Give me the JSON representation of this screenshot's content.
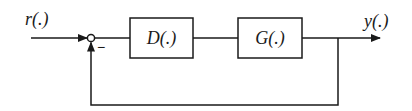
{
  "diagram": {
    "type": "feedback-control-loop",
    "input": {
      "label": "r(.)"
    },
    "output": {
      "label": "y(.)"
    },
    "summing_junction": {
      "sign_feedback": "−"
    },
    "blocks": [
      {
        "id": "controller",
        "label": "D(.)"
      },
      {
        "id": "plant",
        "label": "G(.)"
      }
    ],
    "edges": [
      {
        "from": "input",
        "to": "summing_junction"
      },
      {
        "from": "summing_junction",
        "to": "controller"
      },
      {
        "from": "controller",
        "to": "plant"
      },
      {
        "from": "plant",
        "to": "output"
      },
      {
        "from": "output",
        "to": "summing_junction",
        "sign": "−"
      }
    ],
    "stroke_color": "#1a1a1a"
  }
}
